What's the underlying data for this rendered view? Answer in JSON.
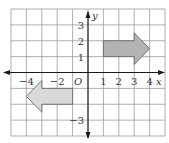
{
  "figure": {
    "type": "coordinate-grid",
    "x_range": [
      -5,
      5
    ],
    "y_range": [
      -4,
      4
    ],
    "x_axis_label": "x",
    "y_axis_label": "y",
    "origin_label": "O",
    "x_ticks": [
      {
        "value": -4,
        "label": "−4"
      },
      {
        "value": -2,
        "label": "−2"
      },
      {
        "value": 1,
        "label": "1"
      },
      {
        "value": 2,
        "label": "2"
      },
      {
        "value": 3,
        "label": "3"
      },
      {
        "value": 4,
        "label": "4"
      }
    ],
    "y_ticks": [
      {
        "value": 3,
        "label": "3"
      },
      {
        "value": 2,
        "label": "2"
      },
      {
        "value": 1,
        "label": "1"
      },
      {
        "value": -3,
        "label": "−3"
      }
    ],
    "shapes": [
      {
        "name": "right-arrow-shape",
        "fill": "#b3b3b3",
        "points": [
          [
            1,
            1
          ],
          [
            3,
            1
          ],
          [
            3,
            0.5
          ],
          [
            4,
            1.5
          ],
          [
            3,
            2.5
          ],
          [
            3,
            2
          ],
          [
            1,
            2
          ]
        ]
      },
      {
        "name": "left-arrow-shape",
        "fill": "#d9d9d9",
        "points": [
          [
            -1,
            -1
          ],
          [
            -3,
            -1
          ],
          [
            -3,
            -0.5
          ],
          [
            -4,
            -1.5
          ],
          [
            -3,
            -2.5
          ],
          [
            -3,
            -2
          ],
          [
            -1,
            -2
          ]
        ]
      }
    ]
  }
}
